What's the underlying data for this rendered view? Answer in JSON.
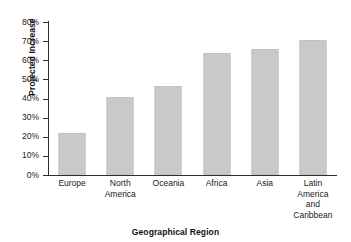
{
  "chart_data": {
    "type": "bar",
    "title": "",
    "xlabel": "Geographical Region",
    "ylabel": "Projected Increase",
    "categories": [
      "Europe",
      "North America",
      "Oceania",
      "Africa",
      "Asia",
      "Latin America and Caribbean"
    ],
    "category_lines": [
      [
        "Europe"
      ],
      [
        "North",
        "America"
      ],
      [
        "Oceania"
      ],
      [
        "Africa"
      ],
      [
        "Asia"
      ],
      [
        "Latin",
        "America",
        "and",
        "Caribbean"
      ]
    ],
    "values": [
      22,
      41,
      46.5,
      64,
      66,
      70.5
    ],
    "ylim": [
      0,
      80
    ],
    "ytick_values": [
      0,
      10,
      20,
      30,
      40,
      50,
      60,
      70,
      80
    ],
    "ytick_labels": [
      "0%",
      "10%",
      "20%",
      "30%",
      "40%",
      "50%",
      "60%",
      "70%",
      "80%"
    ],
    "value_unit": "%",
    "grid": false,
    "legend": false,
    "bar_color": "#c9c9c9",
    "axis_color": "#2e2e2e"
  }
}
